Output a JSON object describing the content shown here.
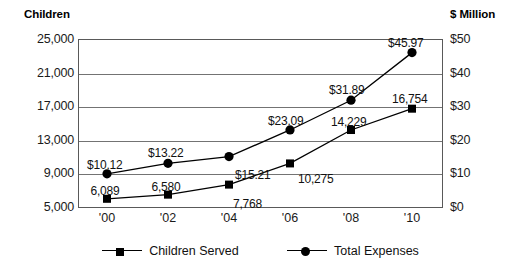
{
  "chart_data": {
    "type": "line",
    "title": "",
    "categories": [
      "'00",
      "'02",
      "'04",
      "'06",
      "'08",
      "'10"
    ],
    "x": [
      2000,
      2002,
      2004,
      2006,
      2008,
      2010
    ],
    "grid": true,
    "legend_position": "bottom",
    "left_axis": {
      "label": "Children",
      "ticks": [
        "5,000",
        "9,000",
        "13,000",
        "17,000",
        "21,000",
        "25,000"
      ],
      "tick_values": [
        5000,
        9000,
        13000,
        17000,
        21000,
        25000
      ],
      "ylim": [
        5000,
        25000
      ]
    },
    "right_axis": {
      "label": "$ Million",
      "ticks": [
        "$0",
        "$10",
        "$20",
        "$30",
        "$40",
        "$50"
      ],
      "tick_values": [
        0,
        10,
        20,
        30,
        40,
        50
      ],
      "ylim": [
        0,
        50
      ]
    },
    "series": [
      {
        "name": "Children Served",
        "axis": "left",
        "marker": "square",
        "values": [
          6089,
          6580,
          7768,
          10275,
          14229,
          16754
        ],
        "point_labels": [
          "6,089",
          "6,580",
          "7,768",
          "10,275",
          "14,229",
          "16,754"
        ]
      },
      {
        "name": "Total Expenses",
        "axis": "right",
        "marker": "circle",
        "values": [
          10.12,
          13.22,
          15.21,
          23.09,
          31.89,
          45.97
        ],
        "point_labels": [
          "$10.12",
          "$13.22",
          "$15.21",
          "$23.09",
          "$31.89",
          "$45.97"
        ]
      }
    ],
    "colors": {
      "series_line": "#000000",
      "frame": "#595959",
      "gridline": "#737373",
      "text": "#111111",
      "background": "#ffffff"
    }
  }
}
